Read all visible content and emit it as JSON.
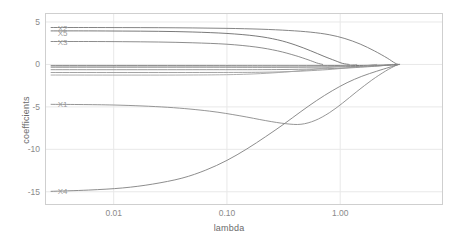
{
  "chart_data": {
    "type": "line",
    "title": "",
    "xlabel": "lambda",
    "ylabel": "coefficients",
    "xscale": "log",
    "xlim": [
      0.0025,
      8.0
    ],
    "ylim": [
      -16.5,
      6.0
    ],
    "grid": true,
    "legend_position": "inline-left-labels",
    "xticks": [
      0.01,
      0.1,
      1.0
    ],
    "xtick_labels": [
      "0.01",
      "0.10",
      "1.00"
    ],
    "yticks": [
      5,
      0,
      -5,
      -10,
      -15
    ],
    "ytick_labels": [
      "5",
      "0",
      "-5",
      "-10",
      "-15"
    ],
    "annotations": [
      {
        "text": "X2",
        "x": 0.0032,
        "y": 4.35
      },
      {
        "text": "X5",
        "x": 0.0032,
        "y": 3.75
      },
      {
        "text": "X3",
        "x": 0.0032,
        "y": 2.7
      },
      {
        "text": "X1",
        "x": 0.0032,
        "y": -4.7
      },
      {
        "text": "X4",
        "x": 0.0032,
        "y": -14.95
      }
    ],
    "series": [
      {
        "name": "X2",
        "color": "#777777",
        "x": [
          0.0028,
          0.006,
          0.012,
          0.025,
          0.05,
          0.1,
          0.2,
          0.35,
          0.55,
          0.8,
          1.1,
          1.5,
          2.0,
          2.6,
          3.05,
          3.3
        ],
        "values": [
          4.35,
          4.35,
          4.34,
          4.33,
          4.3,
          4.25,
          4.15,
          4.0,
          3.8,
          3.5,
          3.05,
          2.4,
          1.6,
          0.75,
          0.15,
          0.0
        ]
      },
      {
        "name": "X5",
        "color": "#6b6b6b",
        "x": [
          0.0028,
          0.006,
          0.012,
          0.025,
          0.05,
          0.1,
          0.18,
          0.28,
          0.4,
          0.55,
          0.72,
          0.9,
          1.05,
          1.2
        ],
        "values": [
          3.95,
          3.95,
          3.93,
          3.9,
          3.82,
          3.65,
          3.35,
          2.9,
          2.3,
          1.6,
          0.95,
          0.45,
          0.12,
          0.0
        ]
      },
      {
        "name": "X3",
        "color": "#808080",
        "x": [
          0.0028,
          0.006,
          0.012,
          0.025,
          0.05,
          0.1,
          0.18,
          0.28,
          0.4,
          0.52,
          0.62,
          0.7
        ],
        "values": [
          2.7,
          2.7,
          2.68,
          2.64,
          2.55,
          2.38,
          2.05,
          1.6,
          1.05,
          0.55,
          0.18,
          0.0
        ]
      },
      {
        "name": "flat-a",
        "color": "#6a6a6a",
        "x": [
          0.0028,
          0.05,
          0.3,
          1.0,
          2.0,
          3.05,
          3.3
        ],
        "values": [
          -0.15,
          -0.15,
          -0.16,
          -0.14,
          -0.1,
          -0.03,
          0.0
        ]
      },
      {
        "name": "flat-b",
        "color": "#777777",
        "x": [
          0.0028,
          0.05,
          0.3,
          1.0,
          2.0,
          3.05,
          3.3
        ],
        "values": [
          -0.32,
          -0.32,
          -0.33,
          -0.28,
          -0.18,
          -0.05,
          0.0
        ]
      },
      {
        "name": "flat-c",
        "color": "#8c8c8c",
        "x": [
          0.0028,
          0.05,
          0.3,
          1.0,
          2.0,
          2.6,
          2.9
        ],
        "values": [
          -0.62,
          -0.62,
          -0.6,
          -0.45,
          -0.22,
          -0.06,
          0.0
        ]
      },
      {
        "name": "flat-d",
        "color": "#9a9a9a",
        "x": [
          0.0028,
          0.05,
          0.25,
          0.7,
          1.4,
          1.9,
          2.1
        ],
        "values": [
          -0.95,
          -0.95,
          -0.9,
          -0.65,
          -0.28,
          -0.07,
          0.0
        ]
      },
      {
        "name": "flat-e",
        "color": "#a5a5a5",
        "x": [
          0.0028,
          0.04,
          0.15,
          0.4,
          0.8,
          1.2,
          1.4
        ],
        "values": [
          -1.25,
          -1.25,
          -1.15,
          -0.8,
          -0.35,
          -0.08,
          0.0
        ]
      },
      {
        "name": "X1",
        "color": "#8a8a8a",
        "x": [
          0.0028,
          0.01,
          0.03,
          0.07,
          0.13,
          0.22,
          0.33,
          0.45,
          0.6,
          0.8,
          1.05,
          1.4,
          1.9,
          2.5,
          3.1,
          3.3
        ],
        "values": [
          -4.7,
          -4.78,
          -5.05,
          -5.5,
          -6.05,
          -6.62,
          -6.98,
          -7.05,
          -6.6,
          -5.7,
          -4.55,
          -3.2,
          -1.85,
          -0.8,
          -0.12,
          0.0
        ]
      },
      {
        "name": "X4",
        "color": "#808080",
        "x": [
          0.0028,
          0.006,
          0.012,
          0.022,
          0.04,
          0.065,
          0.1,
          0.15,
          0.22,
          0.32,
          0.45,
          0.62,
          0.85,
          1.15,
          1.55,
          2.1,
          2.7,
          3.2,
          3.35
        ],
        "values": [
          -14.95,
          -14.8,
          -14.55,
          -14.1,
          -13.4,
          -12.45,
          -11.3,
          -9.95,
          -8.5,
          -7.0,
          -5.55,
          -4.25,
          -3.1,
          -2.15,
          -1.4,
          -0.8,
          -0.35,
          -0.05,
          0.0
        ]
      }
    ]
  },
  "axes": {
    "ylabel": "coefficients",
    "xlabel": "lambda"
  }
}
